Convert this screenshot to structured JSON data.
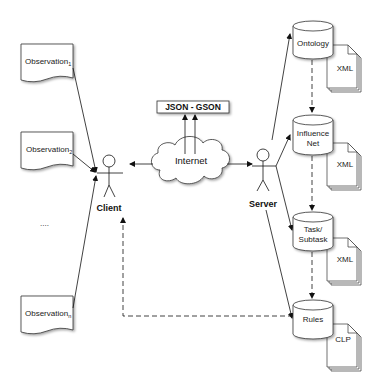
{
  "diagram": {
    "observations": [
      {
        "label": "Observation",
        "subscript": "1"
      },
      {
        "label": "Observation",
        "subscript": "2"
      },
      {
        "label": "Observation",
        "subscript": "n"
      }
    ],
    "ellipsis": "....",
    "client": {
      "label": "Client"
    },
    "server": {
      "label": "Server"
    },
    "internet": {
      "label": "Internet"
    },
    "protocol": {
      "label": "JSON - GSON"
    },
    "stores": [
      {
        "label_line1": "Ontology",
        "label_line2": "",
        "doc_label": "XML"
      },
      {
        "label_line1": "Influence",
        "label_line2": "Net",
        "doc_label": "XML"
      },
      {
        "label_line1": "Task/",
        "label_line2": "Subtask",
        "doc_label": "XML"
      },
      {
        "label_line1": "Rules",
        "label_line2": "",
        "doc_label": "CLP"
      }
    ]
  }
}
